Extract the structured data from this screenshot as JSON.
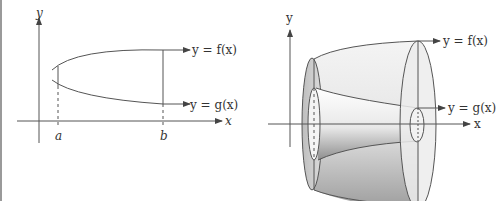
{
  "left_figure": {
    "axis_x_label": "x",
    "axis_y_label": "y",
    "curve_top_label": "y = f(x)",
    "curve_bottom_label": "y = g(x)",
    "bound_left_label": "a",
    "bound_right_label": "b"
  },
  "right_figure": {
    "axis_x_label": "x",
    "axis_y_label": "y",
    "outer_surface_label": "y = f(x)",
    "inner_surface_label": "y = g(x)"
  },
  "colors": {
    "line": "#555555",
    "solid_light": "#f0f0f0",
    "solid_mid": "#cfcfcf",
    "solid_dark": "#9a9a9a"
  }
}
